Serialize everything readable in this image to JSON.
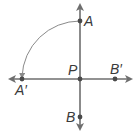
{
  "diagram": {
    "type": "geometry-rotation",
    "colors": {
      "line": "#6e6e6e",
      "point": "#4a4a4a",
      "arc": "#8a8a8a",
      "label": "#3a3a3a"
    },
    "points": [
      {
        "id": "A",
        "label": "A",
        "x": 80,
        "y": 21
      },
      {
        "id": "A_prime",
        "label": "A′",
        "x": 22,
        "y": 79
      },
      {
        "id": "P",
        "label": "P",
        "x": 80,
        "y": 79
      },
      {
        "id": "B_prime",
        "label": "B′",
        "x": 115,
        "y": 79
      },
      {
        "id": "B",
        "label": "B",
        "x": 80,
        "y": 117
      }
    ],
    "lines": [
      {
        "id": "line-AB",
        "description": "vertical line through A, P, B with arrows at both ends"
      },
      {
        "id": "line-A'B'",
        "description": "horizontal line through A', P, B' with arrows at both ends"
      }
    ],
    "arc": {
      "from": "A",
      "to": "A′",
      "center": "P",
      "description": "90° counterclockwise rotation arc"
    }
  }
}
